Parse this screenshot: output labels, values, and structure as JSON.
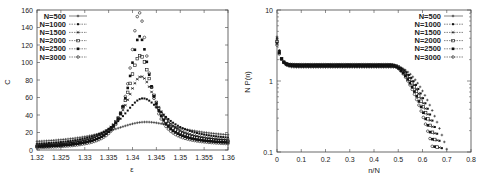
{
  "chart_data": [
    {
      "type": "scatter",
      "title": "",
      "xlabel": "ε",
      "ylabel": "C",
      "xlim": [
        1.32,
        1.36
      ],
      "ylim": [
        0,
        160
      ],
      "yscale": "linear",
      "grid": false,
      "legend_position": "top-left",
      "x_ticks": [
        "1.32",
        "1.325",
        "1.33",
        "1.335",
        "1.34",
        "1.345",
        "1.35",
        "1.355",
        "1.36"
      ],
      "y_ticks": [
        "0",
        "20",
        "40",
        "60",
        "80",
        "100",
        "120",
        "140",
        "160"
      ],
      "series": [
        {
          "name": "N=500",
          "peak_x": 1.3428,
          "peak_y": 32,
          "width": 0.0095,
          "base_left": 6,
          "base_right": 13
        },
        {
          "name": "N=1000",
          "peak_x": 1.3422,
          "peak_y": 59,
          "width": 0.0055,
          "base_left": 4,
          "base_right": 10
        },
        {
          "name": "N=1500",
          "peak_x": 1.3418,
          "peak_y": 84,
          "width": 0.004,
          "base_left": 3,
          "base_right": 8
        },
        {
          "name": "N=2000",
          "peak_x": 1.3416,
          "peak_y": 108,
          "width": 0.0032,
          "base_left": 2,
          "base_right": 7
        },
        {
          "name": "N=2500",
          "peak_x": 1.3415,
          "peak_y": 130,
          "width": 0.0027,
          "base_left": 2,
          "base_right": 6
        },
        {
          "name": "N=3000",
          "peak_x": 1.3414,
          "peak_y": 157,
          "width": 0.0023,
          "base_left": 1,
          "base_right": 5
        }
      ]
    },
    {
      "type": "scatter",
      "title": "",
      "xlabel": "n/N",
      "ylabel": "N P(n)",
      "xlim": [
        0,
        0.8
      ],
      "ylim": [
        0.1,
        10
      ],
      "yscale": "log",
      "grid": false,
      "legend_position": "top-right",
      "x_ticks": [
        "0",
        "0.1",
        "0.2",
        "0.3",
        "0.4",
        "0.5",
        "0.6",
        "0.7",
        "0.8"
      ],
      "y_ticks": [
        "0.1",
        "1",
        "10"
      ],
      "series": [
        {
          "name": "N=500",
          "start": 4.2,
          "plateau": 1.55,
          "knee": 0.5,
          "cutoff": 0.7
        },
        {
          "name": "N=1000",
          "start": 4.0,
          "plateau": 1.6,
          "knee": 0.49,
          "cutoff": 0.68
        },
        {
          "name": "N=1500",
          "start": 3.8,
          "plateau": 1.63,
          "knee": 0.48,
          "cutoff": 0.67
        },
        {
          "name": "N=2000",
          "start": 3.6,
          "plateau": 1.66,
          "knee": 0.48,
          "cutoff": 0.66
        },
        {
          "name": "N=2500",
          "start": 3.4,
          "plateau": 1.68,
          "knee": 0.47,
          "cutoff": 0.65
        },
        {
          "name": "N=3000",
          "start": 3.2,
          "plateau": 1.7,
          "knee": 0.47,
          "cutoff": 0.64
        }
      ]
    }
  ],
  "left_plot": {
    "xlabel": "ε",
    "ylabel": "C",
    "legend": [
      "N=500",
      "N=1000",
      "N=1500",
      "N=2000",
      "N=2500",
      "N=3000"
    ]
  },
  "right_plot": {
    "xlabel": "n/N",
    "ylabel": "N P(n)",
    "legend": [
      "N=500",
      "N=1000",
      "N=1500",
      "N=2000",
      "N=2500",
      "N=3000"
    ]
  },
  "colors": {
    "axis": "#444444",
    "marker": "#111111",
    "text": "#222222"
  }
}
